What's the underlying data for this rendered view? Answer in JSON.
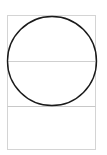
{
  "diagram": {
    "width": 107,
    "height": 155,
    "outer_rect": {
      "x": 7.5,
      "y": 15.5,
      "w": 88,
      "h": 134,
      "stroke": "#d4d4d4"
    },
    "mid_line": {
      "y": 61.5,
      "stroke": "#cfcfcf"
    },
    "divider_line": {
      "y": 106.5,
      "stroke": "#c8c8c8"
    },
    "circle": {
      "cx": 52,
      "cy": 61,
      "r": 44.5,
      "stroke": "#1a1a1a",
      "stroke_width": 1.4
    }
  }
}
